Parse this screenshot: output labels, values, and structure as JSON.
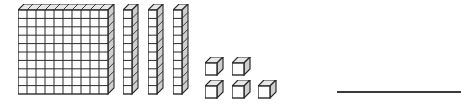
{
  "worksheet": {
    "title": "Base-ten blocks place value model",
    "width": 470,
    "height": 106,
    "background_color": "#ffffff",
    "ink_color": "#2b2b2b",
    "face_fill": "#fdfdfd",
    "top_face_fill": "#e8e8e8",
    "side_face_fill": "#cfcfcf"
  },
  "blocks": {
    "hundreds": {
      "label": "hundreds-flat",
      "count": 1,
      "grid_columns": 10,
      "grid_rows": 10,
      "unit_value": 100,
      "total_value": 100,
      "cell_size": 9,
      "depth": 6
    },
    "tens": {
      "label": "tens-rod",
      "count": 3,
      "segments_per_rod": 10,
      "unit_value": 10,
      "total_value": 30,
      "cell_size": 9,
      "depth": 6
    },
    "ones": {
      "label": "ones-cube",
      "count": 5,
      "unit_value": 1,
      "total_value": 5,
      "rows": [
        {
          "row_label": "top-row",
          "count": 2
        },
        {
          "row_label": "bottom-row",
          "count": 3
        }
      ],
      "cell_size": 12,
      "depth": 6
    }
  },
  "answer": {
    "label": "answer-blank",
    "value": "",
    "placeholder": "",
    "represented_number": 135,
    "line_color": "#3a3a3a",
    "line_width": 124
  }
}
